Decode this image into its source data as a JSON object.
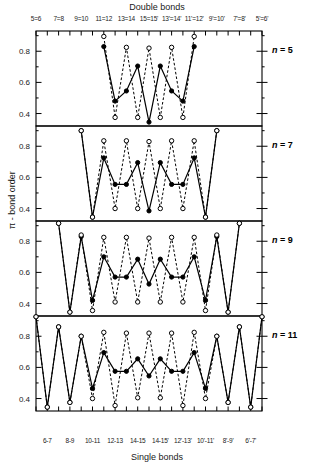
{
  "figure": {
    "top_axis_title": "Double bonds",
    "bottom_axis_title": "Single bonds",
    "y_axis_title": "π - bond order"
  },
  "chart_data": {
    "type": "line",
    "title": "",
    "xlabel": "Single bonds",
    "xlabel_top": "Double bonds",
    "ylabel": "π - bond order",
    "ylim": [
      0.32,
      0.93
    ],
    "yticks": [
      0.4,
      0.6,
      0.8
    ],
    "ytick_labels": [
      "0.4",
      "0.6",
      "0.8"
    ],
    "grid": false,
    "legend": "none",
    "top_tick_labels": [
      "5=6",
      "7=8",
      "9=10",
      "11=12",
      "13=14",
      "15=15'",
      "13'=14'",
      "11'=12'",
      "9'=10'",
      "7'=8'",
      "5'=6'"
    ],
    "bottom_tick_labels": [
      "6-7",
      "8-9",
      "10-11",
      "12-13",
      "14-15",
      "14-15'",
      "12'-13'",
      "10'-11'",
      "8'-9'",
      "6'-7'"
    ],
    "x": [
      1,
      2,
      3,
      4,
      5,
      6,
      7,
      8,
      9,
      10,
      11,
      12,
      13,
      14,
      15,
      16,
      17,
      18,
      19,
      20,
      21
    ],
    "x_kind": [
      "double",
      "single",
      "double",
      "single",
      "double",
      "single",
      "double",
      "single",
      "double",
      "single",
      "double",
      "single",
      "double",
      "single",
      "double",
      "single",
      "double",
      "single",
      "double",
      "single",
      "double"
    ],
    "panels": [
      {
        "label": "n = 5",
        "n": 5,
        "series": [
          {
            "name": "solid-filled",
            "marker": "filled-circle",
            "line": "solid",
            "x": [
              7,
              8,
              9,
              10,
              11,
              12,
              13,
              14,
              15
            ],
            "values": [
              0.83,
              0.48,
              0.545,
              0.705,
              0.345,
              0.705,
              0.545,
              0.48,
              0.83
            ]
          },
          {
            "name": "dashed-open",
            "marker": "open-circle",
            "line": "dashed",
            "x": [
              7,
              8,
              9,
              10,
              11,
              12,
              13,
              14,
              15
            ],
            "values": [
              0.895,
              0.375,
              0.825,
              0.375,
              0.82,
              0.375,
              0.825,
              0.375,
              0.895
            ]
          }
        ]
      },
      {
        "label": "n = 7",
        "n": 7,
        "series": [
          {
            "name": "solid-filled",
            "marker": "filled-circle",
            "line": "solid",
            "x": [
              5,
              6,
              7,
              8,
              9,
              10,
              11,
              12,
              13,
              14,
              15,
              16,
              17
            ],
            "values": [
              0.9,
              0.345,
              0.725,
              0.555,
              0.555,
              0.695,
              0.385,
              0.695,
              0.555,
              0.555,
              0.725,
              0.345,
              0.9
            ]
          },
          {
            "name": "dashed-open",
            "marker": "open-circle",
            "line": "dashed",
            "x": [
              5,
              6,
              7,
              8,
              9,
              10,
              11,
              12,
              13,
              14,
              15,
              16,
              17
            ],
            "values": [
              0.9,
              0.345,
              0.835,
              0.4,
              0.835,
              0.4,
              0.83,
              0.4,
              0.835,
              0.4,
              0.835,
              0.345,
              0.9
            ]
          }
        ]
      },
      {
        "label": "n = 9",
        "n": 9,
        "series": [
          {
            "name": "solid-filled",
            "marker": "filled-circle",
            "line": "solid",
            "x": [
              3,
              4,
              5,
              6,
              7,
              8,
              9,
              10,
              11,
              12,
              13,
              14,
              15,
              16,
              17,
              18,
              19
            ],
            "values": [
              0.915,
              0.345,
              0.83,
              0.42,
              0.7,
              0.57,
              0.57,
              0.685,
              0.525,
              0.685,
              0.57,
              0.57,
              0.7,
              0.42,
              0.83,
              0.345,
              0.915
            ]
          },
          {
            "name": "dashed-open",
            "marker": "open-circle",
            "line": "dashed",
            "x": [
              3,
              4,
              5,
              6,
              7,
              8,
              9,
              10,
              11,
              12,
              13,
              14,
              15,
              16,
              17,
              18,
              19
            ],
            "values": [
              0.915,
              0.345,
              0.84,
              0.355,
              0.825,
              0.41,
              0.825,
              0.41,
              0.82,
              0.41,
              0.825,
              0.41,
              0.825,
              0.355,
              0.84,
              0.345,
              0.915
            ]
          }
        ]
      },
      {
        "label": "n = 11",
        "n": 11,
        "series": [
          {
            "name": "solid-filled",
            "marker": "filled-circle",
            "line": "solid",
            "x": [
              1,
              2,
              3,
              4,
              5,
              6,
              7,
              8,
              9,
              10,
              11,
              12,
              13,
              14,
              15,
              16,
              17,
              18,
              19,
              20,
              21
            ],
            "values": [
              0.925,
              0.345,
              0.86,
              0.375,
              0.8,
              0.465,
              0.695,
              0.575,
              0.575,
              0.655,
              0.545,
              0.655,
              0.575,
              0.575,
              0.695,
              0.465,
              0.8,
              0.375,
              0.86,
              0.345,
              0.925
            ]
          },
          {
            "name": "dashed-open",
            "marker": "open-circle",
            "line": "dashed",
            "x": [
              1,
              2,
              3,
              4,
              5,
              6,
              7,
              8,
              9,
              10,
              11,
              12,
              13,
              14,
              15,
              16,
              17,
              18,
              19,
              20,
              21
            ],
            "values": [
              0.925,
              0.345,
              0.86,
              0.375,
              0.8,
              0.4,
              0.825,
              0.355,
              0.82,
              0.405,
              0.82,
              0.405,
              0.82,
              0.355,
              0.825,
              0.4,
              0.8,
              0.375,
              0.86,
              0.345,
              0.925
            ]
          }
        ]
      }
    ]
  }
}
